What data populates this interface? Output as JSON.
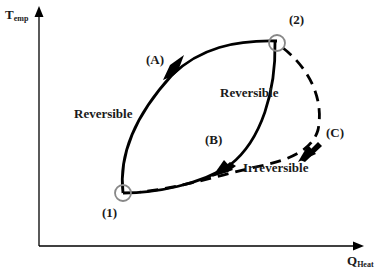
{
  "diagram": {
    "type": "thermodynamic process diagram",
    "axes": {
      "y_label_main": "T",
      "y_label_sub": "emp",
      "x_label_main": "Q",
      "x_label_sub": "Heat"
    },
    "points": [
      {
        "id": "1",
        "label": "(1)"
      },
      {
        "id": "2",
        "label": "(2)"
      }
    ],
    "paths": [
      {
        "id": "A",
        "label": "(A)",
        "from": "1",
        "to": "2",
        "style": "solid",
        "type_label": "Reversible"
      },
      {
        "id": "B",
        "label": "(B)",
        "from": "2",
        "to": "1",
        "style": "solid",
        "type_label": "Reversible"
      },
      {
        "id": "C",
        "label": "(C)",
        "from": "2",
        "to": "1",
        "style": "dashed",
        "type_label": "Irreversible"
      }
    ],
    "labels": {
      "reversible_left": "Reversible",
      "reversible_middle": "Reversible",
      "irreversible": "Irreversible",
      "point_1": "(1)",
      "point_2": "(2)",
      "path_a": "(A)",
      "path_b": "(B)",
      "path_c": "(C)"
    },
    "colors": {
      "line": "#000000",
      "point_circle": "#888888",
      "text": "#1a1a1a"
    }
  }
}
